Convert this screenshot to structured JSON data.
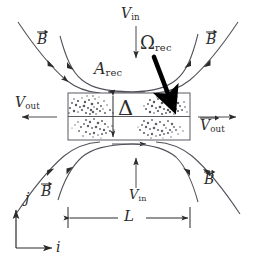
{
  "figure": {
    "background": "#ffffff",
    "ink_color": "#2b2b2b",
    "arrow_color": "#000000",
    "width": 254,
    "height": 267
  },
  "labels": {
    "v_in_top": {
      "symbol": "V",
      "subscript": "in"
    },
    "v_in_bottom": {
      "symbol": "V",
      "subscript": "in"
    },
    "v_out_left": {
      "symbol": "V",
      "subscript": "out"
    },
    "v_out_right": {
      "symbol": "V",
      "subscript": "out"
    },
    "omega_rec": {
      "symbol": "Ω",
      "subscript": "rec"
    },
    "a_rec": {
      "symbol": "A",
      "subscript": "rec"
    },
    "delta": {
      "symbol": "Δ"
    },
    "length_l": {
      "symbol": "L"
    },
    "b_top_left": {
      "symbol": "B"
    },
    "b_top_right": {
      "symbol": "B"
    },
    "b_bottom_left": {
      "symbol": "B"
    },
    "b_bottom_right": {
      "symbol": "B"
    },
    "axis_i": {
      "symbol": "i"
    },
    "axis_j": {
      "symbol": "j"
    }
  },
  "annotations": {
    "sheet_region_name": "current-sheet",
    "sheet_texture": "turbulent-speckle",
    "inflow_direction": "vertical",
    "outflow_direction": "horizontal",
    "thickness_symbol": "Δ",
    "length_symbol": "L"
  }
}
